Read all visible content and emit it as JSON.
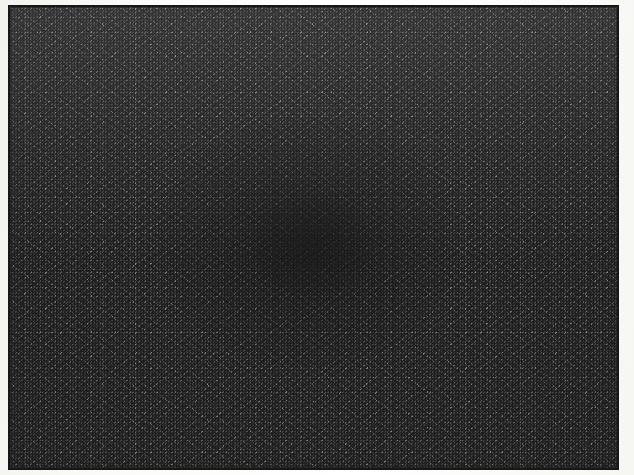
{
  "document": {
    "kind": "scanned-image",
    "title": "Random noise field with central radial vignette",
    "canvas_width": 634,
    "canvas_height": 475,
    "page_background_color": "#f8f8f6",
    "has_visible_text": false,
    "caption": ""
  },
  "plate": {
    "name": "noise-plate",
    "left": 8,
    "top": 5,
    "width": 611,
    "height": 465,
    "border_color": "#17171a",
    "border_width_px": 2,
    "fill_description": "full-bleed high-frequency black-and-white dither noise"
  },
  "noise": {
    "pattern": "salt-and-pepper binary dither",
    "cell_size_px": 2,
    "mean_gray": "#9a9a9a",
    "dark_value": "#17171a",
    "light_value": "#f5f5f5",
    "has_horizontal_banding": true,
    "band_period_px": 22
  },
  "vignette": {
    "name": "central-dark-blob",
    "center_x": 305,
    "center_y": 240,
    "radius_x": 150,
    "radius_y": 125,
    "peak_darkness": 0.62,
    "shape": "ellipse",
    "blend": "multiply"
  },
  "margins": {
    "left_px": 8,
    "top_px": 5,
    "right_px": 15,
    "bottom_px": 5,
    "color": "#f8f8f6"
  }
}
